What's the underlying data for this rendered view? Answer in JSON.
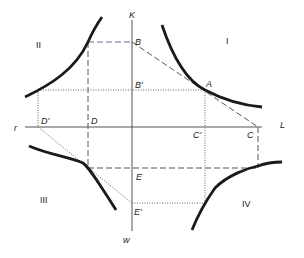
{
  "diagram": {
    "axes": {
      "vertical_top": "K",
      "vertical_bottom": "w",
      "horizontal_left": "r",
      "horizontal_right": "L"
    },
    "quadrants": [
      "I",
      "II",
      "III",
      "IV"
    ],
    "points": {
      "A": "A",
      "B": "B",
      "B_prime": "B'",
      "C": "C",
      "C_prime": "C'",
      "D": "D",
      "D_prime": "D'",
      "E": "E",
      "E_prime": "E'"
    },
    "colors": {
      "curve": "#1a1a1a",
      "axis": "#555555",
      "dashed": "#555555",
      "dotted": "#666666",
      "dashed_B": "#6a6aa0"
    }
  }
}
